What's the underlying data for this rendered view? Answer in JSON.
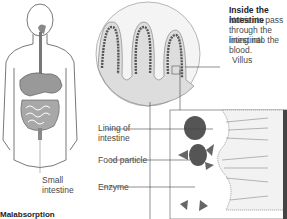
{
  "inside": {
    "title": "Inside the intestine",
    "line1": "Nutrients pass",
    "line2": "through the intestinal",
    "line3": "lining into the blood."
  },
  "labels": {
    "villus": "Villus",
    "lining1": "Lining of",
    "lining2": "intestine",
    "food_particle": "Food particle",
    "enzyme": "Enzyme",
    "small1": "Small",
    "small2": "intestine"
  },
  "section": {
    "heading": "Malabsorption"
  }
}
